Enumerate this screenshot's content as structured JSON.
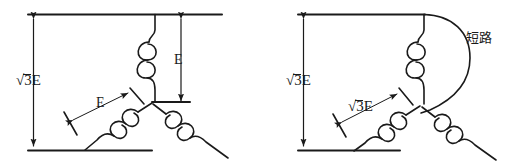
{
  "figure": {
    "type": "diagram",
    "background_color": "#ffffff",
    "line_color": "#1a1a1a"
  },
  "left_diagram": {
    "name": "normal-wye-connection",
    "labels": {
      "line_voltage": "√3E",
      "line_voltage_radicand": "3E",
      "phase_voltage_vertical": "E",
      "phase_voltage_diagonal": "E"
    }
  },
  "right_diagram": {
    "name": "short-circuited-wye-connection",
    "labels": {
      "line_voltage": "√3E",
      "line_voltage_radicand": "3E",
      "phase_voltage_diagonal": "√3E",
      "phase_voltage_diagonal_radicand": "3E",
      "short_circuit": "短路"
    }
  }
}
